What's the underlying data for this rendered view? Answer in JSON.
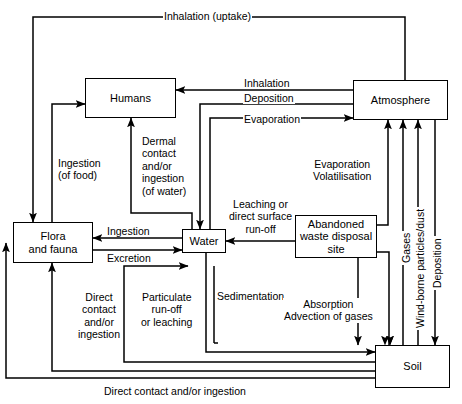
{
  "diagram": {
    "nodes": [
      {
        "id": "humans",
        "label": "Humans"
      },
      {
        "id": "atmosphere",
        "label": "Atmosphere"
      },
      {
        "id": "flora",
        "label": "Flora\nand fauna"
      },
      {
        "id": "water",
        "label": "Water"
      },
      {
        "id": "waste",
        "label": "Abandoned\nwaste disposal\nsite"
      },
      {
        "id": "soil",
        "label": "Soil"
      }
    ],
    "edge_labels": [
      {
        "id": "inhalation-uptake",
        "text": "Inhalation (uptake)"
      },
      {
        "id": "inhalation",
        "text": "Inhalation"
      },
      {
        "id": "deposition-top",
        "text": "Deposition"
      },
      {
        "id": "evaporation-top",
        "text": "Evaporation"
      },
      {
        "id": "ingestion-of-food",
        "text": "Ingestion\n(of food)"
      },
      {
        "id": "dermal-contact-water",
        "text": "Dermal\ncontact\nand/or\ningestion\n(of water)"
      },
      {
        "id": "evaporation-volatilisation",
        "text": "Evaporation\nVolatilisation"
      },
      {
        "id": "leaching-runoff",
        "text": "Leaching or\ndirect surface\nrun-off"
      },
      {
        "id": "ingestion",
        "text": "Ingestion"
      },
      {
        "id": "excretion",
        "text": "Excretion"
      },
      {
        "id": "direct-contact-ingestion-left",
        "text": "Direct\ncontact\nand/or\ningestion"
      },
      {
        "id": "particulate-runoff",
        "text": "Particulate\nrun-off\nor leaching"
      },
      {
        "id": "sedimentation",
        "text": "Sedimentation"
      },
      {
        "id": "absorption-advection",
        "text": "Absorption\nAdvection of gases"
      },
      {
        "id": "gases",
        "text": "Gases"
      },
      {
        "id": "wind-borne-particles",
        "text": "Wind-borne particles/dust"
      },
      {
        "id": "deposition-right",
        "text": "Deposition"
      },
      {
        "id": "direct-contact-bottom",
        "text": "Direct contact and/or ingestion"
      }
    ],
    "colors": {
      "stroke": "#000000",
      "background": "#ffffff"
    }
  }
}
